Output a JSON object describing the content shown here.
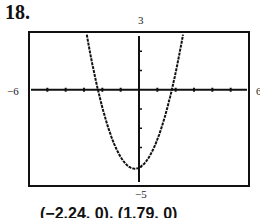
{
  "problem": {
    "number": "18."
  },
  "window": {
    "xmin": -6,
    "xmax": 6,
    "ymin": -5,
    "ymax": 3,
    "xscl": 1,
    "yscl": 1
  },
  "labels": {
    "xmin": "−6",
    "xmax": "6",
    "ymin": "−5",
    "ymax": "3"
  },
  "answer": {
    "text": "(−2.24, 0), (1.79, 0)"
  },
  "chart_data": {
    "type": "line",
    "title": "",
    "xlabel": "",
    "ylabel": "",
    "xlim": [
      -6,
      6
    ],
    "ylim": [
      -5,
      3
    ],
    "grid": false,
    "tick_marks": {
      "x": [
        -6,
        -5,
        -4,
        -3,
        -2,
        -1,
        1,
        2,
        3,
        4,
        5,
        6
      ],
      "y": [
        -5,
        -4,
        -3,
        -2,
        -1,
        1,
        2,
        3
      ]
    },
    "series": [
      {
        "name": "parabola",
        "description": "Upward parabola with vertex near (-0.22, -4.1), x-intercepts at -2.24 and 1.79",
        "x": [
          -2.9,
          -2.24,
          -1.5,
          -1.0,
          -0.5,
          -0.22,
          0,
          0.5,
          1.0,
          1.79,
          2.4
        ],
        "y": [
          3.0,
          0.0,
          -2.2,
          -3.4,
          -3.9,
          -4.1,
          -3.95,
          -3.5,
          -2.6,
          0.0,
          3.0
        ]
      }
    ],
    "annotations": [
      "(−2.24, 0), (1.79, 0)"
    ]
  }
}
